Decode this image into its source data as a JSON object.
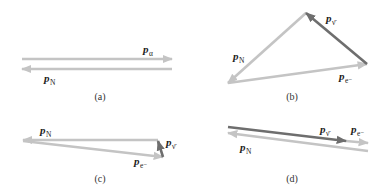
{
  "colors": {
    "light_vector": "#c4c4c4",
    "dark_vector": "#6e6e6e",
    "text": "#222222",
    "background": "#ffffff"
  },
  "panels": [
    {
      "id": "a",
      "caption": "(a)",
      "vectors": [
        {
          "name": "p_alpha",
          "symbol": "p",
          "subscript": "α",
          "tone": "light",
          "from": [
            22,
            59
          ],
          "to": [
            172,
            59
          ]
        },
        {
          "name": "p_N",
          "symbol": "p",
          "subscript": "N",
          "tone": "light",
          "from": [
            172,
            69
          ],
          "to": [
            22,
            69
          ]
        }
      ],
      "labels": [
        {
          "symbol": "p",
          "subscript": "α",
          "x": 143,
          "y": 53
        },
        {
          "symbol": "p",
          "subscript": "N",
          "x": 44,
          "y": 82
        }
      ]
    },
    {
      "id": "b",
      "caption": "(b)",
      "vectors": [
        {
          "name": "p_N",
          "symbol": "p",
          "subscript": "N",
          "tone": "light",
          "from": [
            306,
            13
          ],
          "to": [
            228,
            83
          ]
        },
        {
          "name": "p_e_minus",
          "symbol": "p",
          "subscript": "e⁻",
          "tone": "light",
          "from": [
            228,
            83
          ],
          "to": [
            367,
            64
          ]
        },
        {
          "name": "p_antineutrino",
          "symbol": "p",
          "subscript": "ν̄",
          "tone": "dark",
          "from": [
            367,
            64
          ],
          "to": [
            306,
            13
          ]
        }
      ],
      "labels": [
        {
          "symbol": "p",
          "subscript": "ν̄",
          "x": 326,
          "y": 22
        },
        {
          "symbol": "p",
          "subscript": "N",
          "x": 233,
          "y": 60
        },
        {
          "symbol": "p",
          "subscript": "e⁻",
          "x": 339,
          "y": 80
        }
      ]
    },
    {
      "id": "c",
      "caption": "(c)",
      "vectors": [
        {
          "name": "p_N",
          "symbol": "p",
          "subscript": "N",
          "tone": "light",
          "from": [
            158,
            140
          ],
          "to": [
            23,
            140
          ]
        },
        {
          "name": "p_e_minus",
          "symbol": "p",
          "subscript": "e⁻",
          "tone": "light",
          "from": [
            23,
            141
          ],
          "to": [
            163,
            157
          ]
        },
        {
          "name": "p_antineutrino",
          "symbol": "p",
          "subscript": "ν̄",
          "tone": "dark",
          "from": [
            163,
            157
          ],
          "to": [
            158,
            141
          ]
        }
      ],
      "labels": [
        {
          "symbol": "p",
          "subscript": "N",
          "x": 40,
          "y": 134
        },
        {
          "symbol": "p",
          "subscript": "ν̄",
          "x": 166,
          "y": 146
        },
        {
          "symbol": "p",
          "subscript": "e⁻",
          "x": 134,
          "y": 165
        }
      ]
    },
    {
      "id": "d",
      "caption": "(d)",
      "vectors": [
        {
          "name": "p_antineutrino",
          "symbol": "p",
          "subscript": "ν̄",
          "tone": "dark",
          "from": [
            228,
            127
          ],
          "to": [
            346,
            141
          ]
        },
        {
          "name": "p_e_minus",
          "symbol": "p",
          "subscript": "e⁻",
          "tone": "light",
          "from": [
            346,
            141
          ],
          "to": [
            368,
            143
          ]
        },
        {
          "name": "p_N",
          "symbol": "p",
          "subscript": "N",
          "tone": "light",
          "from": [
            368,
            151
          ],
          "to": [
            228,
            133
          ]
        }
      ],
      "labels": [
        {
          "symbol": "p",
          "subscript": "ν̄",
          "x": 320,
          "y": 133
        },
        {
          "symbol": "p",
          "subscript": "e⁻",
          "x": 351,
          "y": 133
        },
        {
          "symbol": "p",
          "subscript": "N",
          "x": 240,
          "y": 151
        }
      ]
    }
  ],
  "captions": [
    {
      "text": "(a)",
      "x": 100,
      "y": 100
    },
    {
      "text": "(b)",
      "x": 292,
      "y": 100
    },
    {
      "text": "(c)",
      "x": 100,
      "y": 182
    },
    {
      "text": "(d)",
      "x": 292,
      "y": 182
    }
  ]
}
